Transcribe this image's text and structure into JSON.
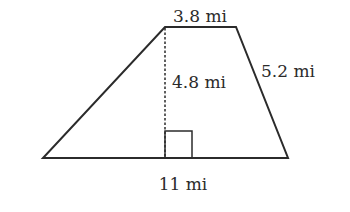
{
  "diagram": {
    "type": "trapezoid",
    "colors": {
      "stroke": "#2b2b2b",
      "background": "#ffffff"
    },
    "labels": {
      "top_base": "3.8 mi",
      "height": "4.8 mi",
      "right_side": "5.2 mi",
      "bottom_base": "11 mi"
    },
    "vertices": {
      "top_left": [
        165,
        27
      ],
      "top_right": [
        236,
        27
      ],
      "bottom_right": [
        288,
        158
      ],
      "bottom_left": [
        43,
        158
      ]
    },
    "height_line": {
      "style": "dashed",
      "x": 165,
      "y1": 27,
      "y2": 158
    },
    "right_angle_marker": {
      "x": 165,
      "y": 131,
      "size": 27
    }
  }
}
